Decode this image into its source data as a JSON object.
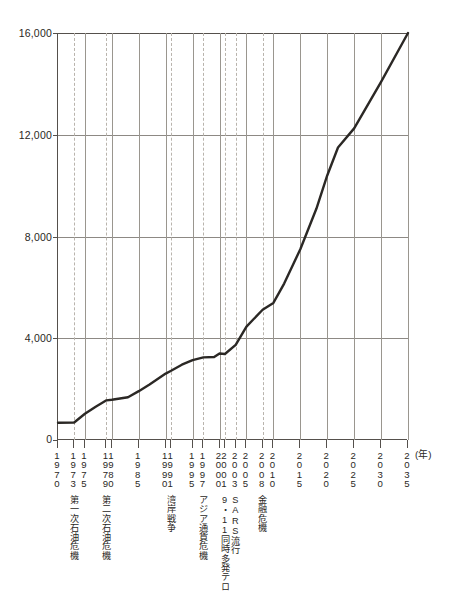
{
  "chart_data": {
    "type": "line",
    "title": "",
    "xlabel": "(年)",
    "ylabel": "",
    "ylim": [
      0,
      16000
    ],
    "xlim": [
      1970,
      2035
    ],
    "grid": true,
    "legend": null,
    "y_ticks": [
      {
        "value": 0,
        "label": "0"
      },
      {
        "value": 4000,
        "label": "4,000"
      },
      {
        "value": 8000,
        "label": "8,000"
      },
      {
        "value": 12000,
        "label": "12,000"
      },
      {
        "value": 16000,
        "label": "16,000"
      }
    ],
    "x_ticks": [
      {
        "value": 1970,
        "label": "1\n9\n7\n0",
        "style": "solid"
      },
      {
        "value": 1973,
        "label": "1\n9\n7\n3",
        "style": "dashed"
      },
      {
        "value": 1975,
        "label": "1\n9\n7\n5",
        "style": "solid"
      },
      {
        "value": 1979,
        "label": "1\n9\n7\n9",
        "style": "dashed"
      },
      {
        "value": 1980,
        "label": "1\n9\n8\n0",
        "style": "solid"
      },
      {
        "value": 1985,
        "label": "1\n9\n8\n5",
        "style": "solid"
      },
      {
        "value": 1990,
        "label": "1\n9\n9\n0",
        "style": "solid"
      },
      {
        "value": 1991,
        "label": "1\n9\n9\n1",
        "style": "dashed"
      },
      {
        "value": 1995,
        "label": "1\n9\n9\n5",
        "style": "solid"
      },
      {
        "value": 1997,
        "label": "1\n9\n9\n7",
        "style": "dashed"
      },
      {
        "value": 2000,
        "label": "2\n0\n0\n0",
        "style": "solid"
      },
      {
        "value": 2001,
        "label": "2\n0\n0\n1",
        "style": "dashed"
      },
      {
        "value": 2003,
        "label": "2\n0\n0\n3",
        "style": "dashed"
      },
      {
        "value": 2005,
        "label": "2\n0\n0\n5",
        "style": "solid"
      },
      {
        "value": 2008,
        "label": "2\n0\n0\n8",
        "style": "dashed"
      },
      {
        "value": 2010,
        "label": "2\n0\n1\n0",
        "style": "solid"
      },
      {
        "value": 2015,
        "label": "2\n0\n1\n5",
        "style": "solid"
      },
      {
        "value": 2020,
        "label": "2\n0\n2\n0",
        "style": "solid"
      },
      {
        "value": 2025,
        "label": "2\n0\n2\n5",
        "style": "solid"
      },
      {
        "value": 2030,
        "label": "2\n0\n3\n0",
        "style": "solid"
      },
      {
        "value": 2035,
        "label": "2\n0\n3\n5",
        "style": "solid"
      }
    ],
    "events": [
      {
        "year": 1973,
        "label": "第一次石油危機"
      },
      {
        "year": 1979,
        "label": "第二次石油危機"
      },
      {
        "year": 1991,
        "label": "湾岸戦争"
      },
      {
        "year": 1997,
        "label": "アジア通貨危機"
      },
      {
        "year": 2001,
        "label": "9・11同時多発テロ"
      },
      {
        "year": 2003,
        "label": "SARS流行"
      },
      {
        "year": 2008,
        "label": "金融危機"
      }
    ],
    "series": [
      {
        "name": "値",
        "color": "#2b2825",
        "points": [
          {
            "x": 1970,
            "y": 680
          },
          {
            "x": 1973,
            "y": 690
          },
          {
            "x": 1975,
            "y": 1030
          },
          {
            "x": 1977,
            "y": 1310
          },
          {
            "x": 1979,
            "y": 1560
          },
          {
            "x": 1980,
            "y": 1580
          },
          {
            "x": 1983,
            "y": 1680
          },
          {
            "x": 1985,
            "y": 1920
          },
          {
            "x": 1987,
            "y": 2180
          },
          {
            "x": 1990,
            "y": 2610
          },
          {
            "x": 1991,
            "y": 2720
          },
          {
            "x": 1993,
            "y": 2960
          },
          {
            "x": 1995,
            "y": 3140
          },
          {
            "x": 1997,
            "y": 3250
          },
          {
            "x": 1999,
            "y": 3260
          },
          {
            "x": 2000,
            "y": 3400
          },
          {
            "x": 2001,
            "y": 3380
          },
          {
            "x": 2003,
            "y": 3740
          },
          {
            "x": 2005,
            "y": 4460
          },
          {
            "x": 2008,
            "y": 5120
          },
          {
            "x": 2010,
            "y": 5390
          },
          {
            "x": 2012,
            "y": 6150
          },
          {
            "x": 2015,
            "y": 7500
          },
          {
            "x": 2018,
            "y": 9100
          },
          {
            "x": 2020,
            "y": 10400
          },
          {
            "x": 2022,
            "y": 11500
          },
          {
            "x": 2025,
            "y": 12250
          },
          {
            "x": 2030,
            "y": 14080
          },
          {
            "x": 2035,
            "y": 16000
          }
        ]
      }
    ]
  }
}
